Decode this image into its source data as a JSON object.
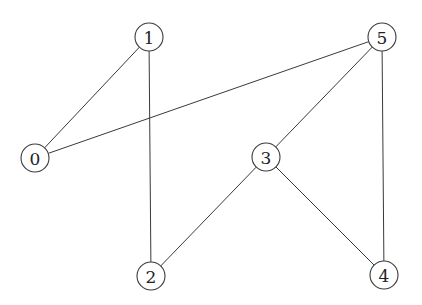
{
  "graph": {
    "type": "undirected",
    "node_radius": 14,
    "nodes": [
      {
        "id": "0",
        "label": "0",
        "x": 35,
        "y": 158
      },
      {
        "id": "1",
        "label": "1",
        "x": 149,
        "y": 37
      },
      {
        "id": "2",
        "label": "2",
        "x": 151,
        "y": 276
      },
      {
        "id": "3",
        "label": "3",
        "x": 266,
        "y": 157
      },
      {
        "id": "4",
        "label": "4",
        "x": 384,
        "y": 275
      },
      {
        "id": "5",
        "label": "5",
        "x": 382,
        "y": 37
      }
    ],
    "edges": [
      {
        "source": "0",
        "target": "1"
      },
      {
        "source": "0",
        "target": "5"
      },
      {
        "source": "1",
        "target": "2"
      },
      {
        "source": "2",
        "target": "3"
      },
      {
        "source": "3",
        "target": "5"
      },
      {
        "source": "3",
        "target": "4"
      },
      {
        "source": "5",
        "target": "4"
      }
    ],
    "colors": {
      "stroke": "#3a3a3a",
      "fill": "#ffffff",
      "text": "#222222"
    }
  }
}
